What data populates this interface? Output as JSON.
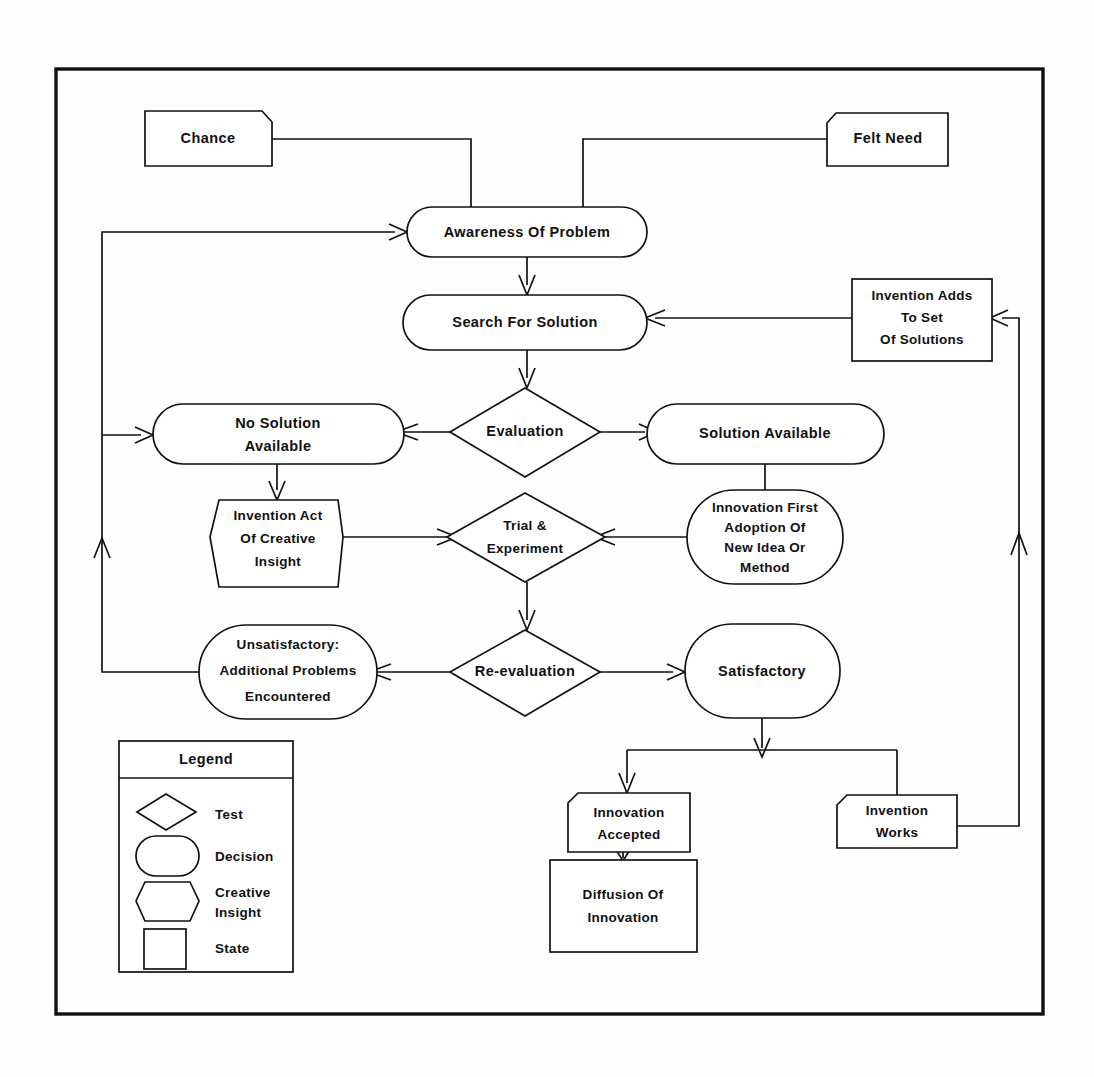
{
  "diagram": {
    "background_color": "#ffffff",
    "line_color": "#111111",
    "shape_fill": "#ffffff"
  },
  "nodes": {
    "chance": {
      "label": "Chance",
      "shape": "state"
    },
    "felt_need": {
      "label": "Felt Need",
      "shape": "state"
    },
    "awareness": {
      "label": "Awareness Of Problem",
      "shape": "decision"
    },
    "search": {
      "label": "Search For Solution",
      "shape": "decision"
    },
    "invention_adds": {
      "line1": "Invention Adds",
      "line2": "To Set",
      "line3": "Of Solutions",
      "shape": "state"
    },
    "evaluation": {
      "label": "Evaluation",
      "shape": "test"
    },
    "no_solution": {
      "line1": "No Solution",
      "line2": "Available",
      "shape": "decision"
    },
    "solution_available": {
      "label": "Solution Available",
      "shape": "decision"
    },
    "invention_act": {
      "line1": "Invention Act",
      "line2": "Of Creative",
      "line3": "Insight",
      "shape": "creative-insight"
    },
    "trial": {
      "line1": "Trial &",
      "line2": "Experiment",
      "shape": "test"
    },
    "innovation_first": {
      "line1": "Innovation First",
      "line2": "Adoption Of",
      "line3": "New Idea Or",
      "line4": "Method",
      "shape": "decision"
    },
    "unsatisfactory": {
      "line1": "Unsatisfactory:",
      "line2": "Additional Problems",
      "line3": "Encountered",
      "shape": "decision"
    },
    "re_evaluation": {
      "label": "Re-evaluation",
      "shape": "test"
    },
    "satisfactory": {
      "label": "Satisfactory",
      "shape": "decision"
    },
    "innovation_accepted": {
      "line1": "Innovation",
      "line2": "Accepted",
      "shape": "state"
    },
    "invention_works": {
      "line1": "Invention",
      "line2": "Works",
      "shape": "state"
    },
    "diffusion": {
      "line1": "Diffusion Of",
      "line2": "Innovation",
      "shape": "state"
    }
  },
  "legend": {
    "title": "Legend",
    "items": [
      {
        "shape": "test",
        "label": "Test"
      },
      {
        "shape": "decision",
        "label": "Decision"
      },
      {
        "shape": "creative-insight",
        "label_line1": "Creative",
        "label_line2": "Insight"
      },
      {
        "shape": "state",
        "label": "State"
      }
    ]
  },
  "edges": [
    {
      "from": "chance",
      "to": "awareness"
    },
    {
      "from": "felt_need",
      "to": "awareness"
    },
    {
      "from": "awareness",
      "to": "search"
    },
    {
      "from": "search",
      "to": "evaluation"
    },
    {
      "from": "evaluation",
      "to": "no_solution"
    },
    {
      "from": "evaluation",
      "to": "solution_available"
    },
    {
      "from": "no_solution",
      "to": "invention_act"
    },
    {
      "from": "solution_available",
      "to": "innovation_first"
    },
    {
      "from": "invention_act",
      "to": "trial"
    },
    {
      "from": "innovation_first",
      "to": "trial"
    },
    {
      "from": "trial",
      "to": "re_evaluation"
    },
    {
      "from": "re_evaluation",
      "to": "unsatisfactory"
    },
    {
      "from": "re_evaluation",
      "to": "satisfactory"
    },
    {
      "from": "unsatisfactory",
      "to": "awareness"
    },
    {
      "from": "satisfactory",
      "to": "innovation_accepted"
    },
    {
      "from": "satisfactory",
      "to": "invention_works"
    },
    {
      "from": "innovation_accepted",
      "to": "diffusion"
    },
    {
      "from": "invention_works",
      "to": "invention_adds"
    },
    {
      "from": "invention_adds",
      "to": "search"
    }
  ]
}
